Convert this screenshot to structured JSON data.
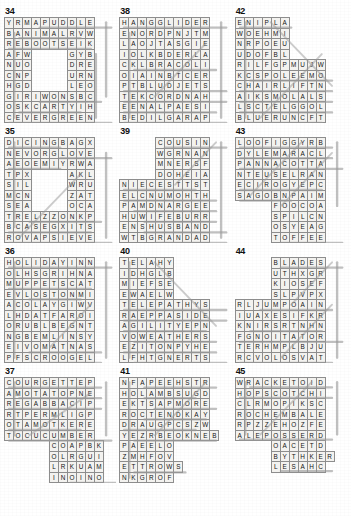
{
  "page": {
    "puzzle_count": 12,
    "columns": 3,
    "grid_fill_color": "#f3f2ef",
    "grid_line_color": "#8d8d8d",
    "strike_color": "#9a9a9a",
    "text_color": "#141414"
  },
  "puzzles": [
    {
      "number": "34",
      "cols": 11,
      "rows": 10,
      "rows_text": [
        "YRMAPUDDLE ",
        "BANIMALRVW ",
        "REBOOTSEIK ",
        "AFW....GYB ",
        "NUO....DRE ",
        "CNP....URN ",
        "HGD....LEO ",
        "GIRIWONSBC ",
        "OSKCARTYIH ",
        "CEVERGREEN "
      ],
      "strikes": [
        {
          "x1": 3,
          "y1": 0.5,
          "x2": 10,
          "y2": 0.5
        },
        {
          "x1": 0.5,
          "y1": 1,
          "x2": 0.5,
          "y2": 9
        },
        {
          "x1": 1,
          "y1": 1.5,
          "x2": 7,
          "y2": 1.5
        },
        {
          "x1": 0,
          "y1": 2.5,
          "x2": 8,
          "y2": 2.5
        },
        {
          "x1": 0,
          "y1": 9.5,
          "x2": 10,
          "y2": 9.5
        },
        {
          "x1": 3,
          "y1": 7.5,
          "x2": 9,
          "y2": 7.5
        },
        {
          "x1": 1,
          "y1": 8.5,
          "x2": 7,
          "y2": 8.5
        },
        {
          "x1": 9.5,
          "y1": 0,
          "x2": 9.5,
          "y2": 7
        },
        {
          "x1": 8.5,
          "y1": 3,
          "x2": 8.5,
          "y2": 9
        }
      ]
    },
    {
      "number": "35",
      "cols": 11,
      "rows": 10,
      "rows_text": [
        "DICINGBAGX ",
        "NEVORGLOVE ",
        "AEOEMIYRWA ",
        "TPX....AKL ",
        "SIL....WRU ",
        "MCN....ZAT ",
        "SEA....OCA ",
        "TRELZZONKP ",
        "BCASEGXITS ",
        "ROVAPSIEVE "
      ],
      "strikes": [
        {
          "x1": 0,
          "y1": 0.5,
          "x2": 5,
          "y2": 0.5
        },
        {
          "x1": 5,
          "y1": 1.5,
          "x2": 10,
          "y2": 1.5
        },
        {
          "x1": 0,
          "y1": 2.5,
          "x2": 5,
          "y2": 2.5
        },
        {
          "x1": 2,
          "y1": 7.5,
          "x2": 9,
          "y2": 7.5
        },
        {
          "x1": 0,
          "y1": 8.5,
          "x2": 8,
          "y2": 8.5
        },
        {
          "x1": 0,
          "y1": 9.5,
          "x2": 10,
          "y2": 9.5
        },
        {
          "x1": 0.5,
          "y1": 0,
          "x2": 0.5,
          "y2": 8
        },
        {
          "x1": 9.5,
          "y1": 1,
          "x2": 9.5,
          "y2": 9
        },
        {
          "x1": 1,
          "y1": 9,
          "x2": 7,
          "y2": 3
        }
      ]
    },
    {
      "number": "36",
      "cols": 11,
      "rows": 10,
      "rows_text": [
        "HOLIDAYINN",
        "OLHSGRIHNA",
        "MUPPETSCAT",
        "EVLOSTONMI",
        "ACOLAYGIWV",
        "LHDATFAROI",
        "ORUBLBEGNT",
        "NGBEMLINSY",
        "EIVOMATNAS",
        "PFSCROOGEL"
      ],
      "strikes": [
        {
          "x1": 0,
          "y1": 0.5,
          "x2": 10,
          "y2": 0.5
        },
        {
          "x1": 0,
          "y1": 2.5,
          "x2": 8,
          "y2": 2.5
        },
        {
          "x1": 2,
          "y1": 3.5,
          "x2": 7,
          "y2": 3.5
        },
        {
          "x1": 2,
          "y1": 9.5,
          "x2": 9,
          "y2": 9.5
        },
        {
          "x1": 2,
          "y1": 8.5,
          "x2": 9,
          "y2": 8.5
        },
        {
          "x1": 0.5,
          "y1": 0,
          "x2": 0.5,
          "y2": 9
        },
        {
          "x1": 9.5,
          "y1": 0,
          "x2": 9.5,
          "y2": 9
        },
        {
          "x1": 4,
          "y1": 8,
          "x2": 8,
          "y2": 4
        }
      ]
    },
    {
      "number": "37",
      "cols": 11,
      "rows": 10,
      "rows_text": [
        "COURGETTEP ",
        "AMOTATOPNE ",
        "REGABBACIP ",
        "RTPERMLIGP ",
        "OTAMOTKERE ",
        "TOCUCUMBER ",
        ".....COAPBK",
        ".....OLRGUI",
        ".....LRKUAM",
        ".....INOINO"
      ],
      "strikes": [
        {
          "x1": 0,
          "y1": 0.5,
          "x2": 9,
          "y2": 0.5
        },
        {
          "x1": 1,
          "y1": 1.5,
          "x2": 9,
          "y2": 1.5
        },
        {
          "x1": 0,
          "y1": 2.5,
          "x2": 9,
          "y2": 2.5
        },
        {
          "x1": 0,
          "y1": 5.5,
          "x2": 10,
          "y2": 5.5
        },
        {
          "x1": 0,
          "y1": 4.5,
          "x2": 7,
          "y2": 4.5
        },
        {
          "x1": 0.5,
          "y1": 0,
          "x2": 0.5,
          "y2": 5
        },
        {
          "x1": 9.5,
          "y1": 0,
          "x2": 9.5,
          "y2": 5
        },
        {
          "x1": 6,
          "y1": 9.5,
          "x2": 11,
          "y2": 9.5
        },
        {
          "x1": 2,
          "y1": 5,
          "x2": 8,
          "y2": 1
        }
      ]
    },
    {
      "number": "38",
      "cols": 11,
      "rows": 10,
      "rows_text": [
        "HANGGLIDER ",
        "ENORDPNJTM ",
        "LAOJTASGIE ",
        "IOLKBDERLA ",
        "CKLBRACOLI ",
        "OIAINBTCER ",
        "PTBLUDJETS ",
        "TEKCORDNAH ",
        "EENALPAESI ",
        "BEDILGARAP "
      ],
      "strikes": [
        {
          "x1": 0,
          "y1": 0.5,
          "x2": 10,
          "y2": 0.5
        },
        {
          "x1": 0,
          "y1": 6.5,
          "x2": 10,
          "y2": 6.5
        },
        {
          "x1": 0,
          "y1": 7.5,
          "x2": 10,
          "y2": 7.5
        },
        {
          "x1": 0,
          "y1": 8.5,
          "x2": 9,
          "y2": 8.5
        },
        {
          "x1": 0,
          "y1": 9.5,
          "x2": 10,
          "y2": 9.5
        },
        {
          "x1": 1,
          "y1": 4.5,
          "x2": 9,
          "y2": 4.5
        },
        {
          "x1": 0.5,
          "y1": 1,
          "x2": 0.5,
          "y2": 9
        },
        {
          "x1": 9.5,
          "y1": 0,
          "x2": 9.5,
          "y2": 9
        },
        {
          "x1": 3,
          "y1": 7,
          "x2": 8,
          "y2": 2
        }
      ]
    },
    {
      "number": "39",
      "cols": 11,
      "rows": 10,
      "rows_text": [
        "....COUSIN ",
        "....WGRNAN ",
        "....MNERSF ",
        "....DOHEIA ",
        "NIECESTTST ",
        "ELCNUMOHTH ",
        "PAMDNARGEE ",
        "HUWIFEBURR ",
        "ENSHUSBAND ",
        "WTBGRANDAD "
      ],
      "strikes": [
        {
          "x1": 4,
          "y1": 0.5,
          "x2": 10,
          "y2": 0.5
        },
        {
          "x1": 0,
          "y1": 4.5,
          "x2": 7,
          "y2": 4.5
        },
        {
          "x1": 0,
          "y1": 5.5,
          "x2": 9,
          "y2": 5.5
        },
        {
          "x1": 1,
          "y1": 6.5,
          "x2": 9,
          "y2": 6.5
        },
        {
          "x1": 2,
          "y1": 7.5,
          "x2": 9,
          "y2": 7.5
        },
        {
          "x1": 2,
          "y1": 8.5,
          "x2": 10,
          "y2": 8.5
        },
        {
          "x1": 3,
          "y1": 9.5,
          "x2": 10,
          "y2": 9.5
        },
        {
          "x1": 9.5,
          "y1": 0,
          "x2": 9.5,
          "y2": 9
        },
        {
          "x1": 5,
          "y1": 4,
          "x2": 9,
          "y2": 0
        }
      ]
    },
    {
      "number": "40",
      "cols": 11,
      "rows": 10,
      "rows_text": [
        "TELAHY.....",
        "IDHGLB.....",
        "MIEFSE.....",
        "EWAELW.....",
        "TELEPATHYS ",
        "RAEPPASIDE ",
        "AGILITYEPN ",
        "VOWEATHERS ",
        "EZITONPYHE ",
        "LFHTGNERTS "
      ],
      "strikes": [
        {
          "x1": 0,
          "y1": 4.5,
          "x2": 10,
          "y2": 4.5
        },
        {
          "x1": 0,
          "y1": 5.5,
          "x2": 10,
          "y2": 5.5
        },
        {
          "x1": 0,
          "y1": 6.5,
          "x2": 8,
          "y2": 6.5
        },
        {
          "x1": 1,
          "y1": 7.5,
          "x2": 9,
          "y2": 7.5
        },
        {
          "x1": 0,
          "y1": 8.5,
          "x2": 9,
          "y2": 8.5
        },
        {
          "x1": 1,
          "y1": 9.5,
          "x2": 10,
          "y2": 9.5
        },
        {
          "x1": 0.5,
          "y1": 0,
          "x2": 0.5,
          "y2": 9
        },
        {
          "x1": 3,
          "y1": 0,
          "x2": 9,
          "y2": 6
        }
      ]
    },
    {
      "number": "41",
      "cols": 11,
      "rows": 10,
      "rows_text": [
        "NFAPEEHSTR ",
        "HOLAMBSUGD ",
        "EKTSAPMORE ",
        "ROCTENDKAY ",
        "DRAUGPCSZW ",
        "YEZRBEOKNEB",
        "PAEELO.....",
        "ZMHFOV.....",
        "ETTROWS....",
        "NKGROF....."
      ],
      "strikes": [
        {
          "x1": 2,
          "y1": 0.5,
          "x2": 9,
          "y2": 0.5
        },
        {
          "x1": 2,
          "y1": 1.5,
          "x2": 7,
          "y2": 1.5
        },
        {
          "x1": 3,
          "y1": 2.5,
          "x2": 9,
          "y2": 2.5
        },
        {
          "x1": 2,
          "y1": 3.5,
          "x2": 8,
          "y2": 3.5
        },
        {
          "x1": 0,
          "y1": 4.5,
          "x2": 7,
          "y2": 4.5
        },
        {
          "x1": 1,
          "y1": 5.5,
          "x2": 9,
          "y2": 5.5
        },
        {
          "x1": 1,
          "y1": 8.5,
          "x2": 6,
          "y2": 8.5
        },
        {
          "x1": 0.5,
          "y1": 0,
          "x2": 0.5,
          "y2": 9
        },
        {
          "x1": 3,
          "y1": 5,
          "x2": 8,
          "y2": 0
        }
      ]
    },
    {
      "number": "42",
      "cols": 11,
      "rows": 10,
      "rows_text": [
        "ENIPLA.....",
        "WOEHMI.....",
        "NRPOEU.....",
        "UDOFBL.....",
        "RILFGPMUJW ",
        "KCSPOLEEMO ",
        "CHAIRLIFTN ",
        "AIKSMOLALS ",
        "LSCTELGGOL ",
        "BLUERUNCFT "
      ],
      "strikes": [
        {
          "x1": 0,
          "y1": 0.5,
          "x2": 5,
          "y2": 0.5
        },
        {
          "x1": 0,
          "y1": 6.5,
          "x2": 9,
          "y2": 6.5
        },
        {
          "x1": 0,
          "y1": 7.5,
          "x2": 9,
          "y2": 7.5
        },
        {
          "x1": 0,
          "y1": 8.5,
          "x2": 9,
          "y2": 8.5
        },
        {
          "x1": 0,
          "y1": 9.5,
          "x2": 8,
          "y2": 9.5
        },
        {
          "x1": 1,
          "y1": 5.5,
          "x2": 9,
          "y2": 5.5
        },
        {
          "x1": 0.5,
          "y1": 0,
          "x2": 0.5,
          "y2": 9
        },
        {
          "x1": 3,
          "y1": 0,
          "x2": 9,
          "y2": 6
        },
        {
          "x1": 2,
          "y1": 9,
          "x2": 8,
          "y2": 3
        }
      ]
    },
    {
      "number": "43",
      "cols": 11,
      "rows": 10,
      "rows_text": [
        "LOOFIGGYRB ",
        "DYLEMARACL ",
        "PANNACOTTA ",
        "NTEUSELRAN ",
        "ECIROGYEPC ",
        "SAGOBNPAIM ",
        "....FOOCOA ",
        "....SPILCN ",
        "....OSYEAG ",
        "....TOFFEE "
      ],
      "strikes": [
        {
          "x1": 0,
          "y1": 0.5,
          "x2": 9,
          "y2": 0.5
        },
        {
          "x1": 0,
          "y1": 1.5,
          "x2": 9,
          "y2": 1.5
        },
        {
          "x1": 0,
          "y1": 2.5,
          "x2": 10,
          "y2": 2.5
        },
        {
          "x1": 0,
          "y1": 4.5,
          "x2": 8,
          "y2": 4.5
        },
        {
          "x1": 0,
          "y1": 5.5,
          "x2": 5,
          "y2": 5.5
        },
        {
          "x1": 4,
          "y1": 9.5,
          "x2": 10,
          "y2": 9.5
        },
        {
          "x1": 9.5,
          "y1": 0,
          "x2": 9.5,
          "y2": 6
        },
        {
          "x1": 1,
          "y1": 5,
          "x2": 6,
          "y2": 0
        },
        {
          "x1": 4,
          "y1": 6,
          "x2": 9,
          "y2": 1
        }
      ]
    },
    {
      "number": "44",
      "cols": 11,
      "rows": 10,
      "rows_text": [
        "....BLADES ",
        "....UTHXGR ",
        "....KIOSEF ",
        "....SLPVPX ",
        "RLJUMPOAIN ",
        "IUAXESIFKR ",
        "KNIRSRTNHN ",
        "FGNOITATOR ",
        "TERHMPLBJU ",
        "RCVOLOSVAT "
      ],
      "strikes": [
        {
          "x1": 4,
          "y1": 0.5,
          "x2": 10,
          "y2": 0.5
        },
        {
          "x1": 2,
          "y1": 4.5,
          "x2": 9,
          "y2": 4.5
        },
        {
          "x1": 0,
          "y1": 7.5,
          "x2": 10,
          "y2": 7.5
        },
        {
          "x1": 1,
          "y1": 6.5,
          "x2": 8,
          "y2": 6.5
        },
        {
          "x1": 0,
          "y1": 9.5,
          "x2": 9,
          "y2": 9.5
        },
        {
          "x1": 9.5,
          "y1": 0,
          "x2": 9.5,
          "y2": 9
        },
        {
          "x1": 4,
          "y1": 9,
          "x2": 9,
          "y2": 4
        },
        {
          "x1": 5,
          "y1": 4,
          "x2": 9,
          "y2": 0
        }
      ]
    },
    {
      "number": "45",
      "cols": 11,
      "rows": 10,
      "rows_text": [
        "WRACKETOID ",
        "HOPSCOTCHI ",
        "CLRMOPIKSC ",
        "ROCHEMBALE ",
        "RPZZEHOZFE ",
        "ALEPOSSERD ",
        "....OACETD ",
        "....BYTHKER",
        "....LESAHC ",
        "..........."
      ],
      "strikes": [
        {
          "x1": 1,
          "y1": 0.5,
          "x2": 9,
          "y2": 0.5
        },
        {
          "x1": 0,
          "y1": 1.5,
          "x2": 9,
          "y2": 1.5
        },
        {
          "x1": 0,
          "y1": 5.5,
          "x2": 9,
          "y2": 5.5
        },
        {
          "x1": 4,
          "y1": 8.5,
          "x2": 9,
          "y2": 8.5
        },
        {
          "x1": 0.5,
          "y1": 0,
          "x2": 0.5,
          "y2": 5
        },
        {
          "x1": 9.5,
          "y1": 0,
          "x2": 9.5,
          "y2": 5
        },
        {
          "x1": 2,
          "y1": 5,
          "x2": 7,
          "y2": 0
        }
      ]
    }
  ]
}
